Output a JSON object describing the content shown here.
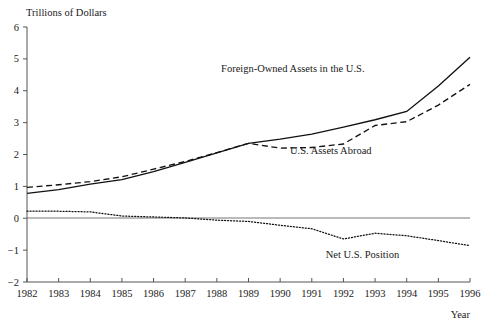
{
  "chart_data": {
    "type": "line",
    "title": "",
    "ylabel": "Trillions of Dollars",
    "xlabel": "Year",
    "x": [
      1982,
      1983,
      1984,
      1985,
      1986,
      1987,
      1988,
      1989,
      1990,
      1991,
      1992,
      1993,
      1994,
      1995,
      1996
    ],
    "categories": [
      "1982",
      "1983",
      "1984",
      "1985",
      "1986",
      "1987",
      "1988",
      "1989",
      "1990",
      "1991",
      "1992",
      "1993",
      "1994",
      "1995",
      "1996"
    ],
    "xlim": [
      1982,
      1996
    ],
    "ylim": [
      -2,
      6
    ],
    "yticks": [
      -2,
      -1,
      0,
      1,
      2,
      3,
      4,
      5,
      6
    ],
    "ytick_labels": [
      "−2",
      "−1",
      "0",
      "1",
      "2",
      "3",
      "4",
      "5",
      "6"
    ],
    "grid": false,
    "legend": "inline-annotations",
    "zero_line": 0,
    "series": [
      {
        "name": "Foreign-Owned Assets in the U.S.",
        "style": "solid",
        "color": "#111111",
        "label_x": 1990.4,
        "label_y": 4.6,
        "values": [
          0.78,
          0.9,
          1.07,
          1.21,
          1.46,
          1.75,
          2.05,
          2.35,
          2.48,
          2.64,
          2.86,
          3.09,
          3.35,
          4.15,
          5.05
        ]
      },
      {
        "name": "U.S. Assets Abroad",
        "style": "dashed",
        "color": "#111111",
        "label_x": 1991.6,
        "label_y": 2.02,
        "values": [
          0.97,
          1.05,
          1.15,
          1.3,
          1.54,
          1.78,
          2.06,
          2.35,
          2.2,
          2.22,
          2.33,
          2.91,
          3.03,
          3.55,
          4.2
        ]
      },
      {
        "name": "Net U.S. Position",
        "style": "dotted",
        "color": "#111111",
        "label_x": 1992.6,
        "label_y": -1.24,
        "values": [
          0.22,
          0.22,
          0.2,
          0.07,
          0.04,
          0.01,
          -0.06,
          -0.1,
          -0.22,
          -0.33,
          -0.65,
          -0.47,
          -0.55,
          -0.7,
          -0.86
        ]
      }
    ],
    "annotations": [
      {
        "text": "Foreign-Owned Assets in the U.S.",
        "x": 1990.4,
        "y": 4.6
      },
      {
        "text": "U.S. Assets Abroad",
        "x": 1991.6,
        "y": 2.02
      },
      {
        "text": "Net U.S. Position",
        "x": 1992.6,
        "y": -1.24
      }
    ]
  }
}
